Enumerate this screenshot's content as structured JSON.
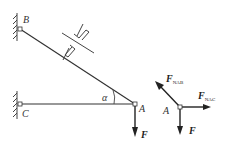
{
  "diagram": {
    "points": {
      "B": "B",
      "C": "C",
      "A_left": "A",
      "A_right": "A"
    },
    "angle_label": "α",
    "force_label": "F",
    "free_body": {
      "force_ab": {
        "main": "F",
        "sub": "NAB"
      },
      "force_ac": {
        "main": "F",
        "sub": "NAC"
      },
      "force_down": "F"
    }
  }
}
